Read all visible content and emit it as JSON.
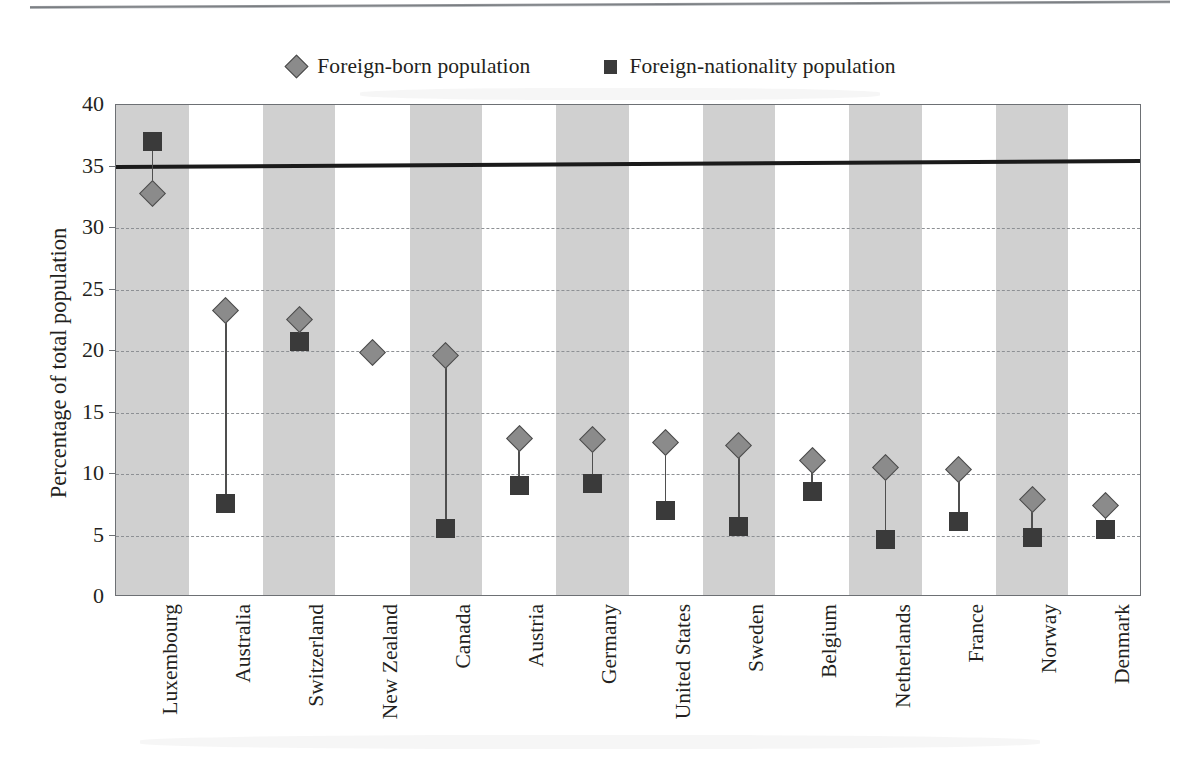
{
  "chart_data": {
    "type": "scatter",
    "title": "",
    "subtitle": "",
    "xlabel": "",
    "ylabel": "Percentage of total population",
    "ylim": [
      0,
      40
    ],
    "ytick_step": 5,
    "yticks": [
      "0",
      "5",
      "10",
      "15",
      "20",
      "25",
      "30",
      "35",
      "40"
    ],
    "grid": "horizontal-dashed",
    "legend_position": "top-center",
    "reference_line": {
      "value": 35,
      "style": "thick-solid",
      "color": "#1b1b1b"
    },
    "categories": [
      "Luxembourg",
      "Australia",
      "Switzerland",
      "New Zealand",
      "Canada",
      "Austria",
      "Germany",
      "United States",
      "Sweden",
      "Belgium",
      "Netherlands",
      "France",
      "Norway",
      "Denmark"
    ],
    "series": [
      {
        "name": "Foreign-born population",
        "marker": "diamond",
        "color": "#8b8b8b",
        "values": [
          32.8,
          23.3,
          22.6,
          19.9,
          19.6,
          12.9,
          12.8,
          12.6,
          12.3,
          11.1,
          10.5,
          10.4,
          7.9,
          7.4
        ]
      },
      {
        "name": "Foreign-nationality population",
        "marker": "square",
        "color": "#3a3a3a",
        "values": [
          37.0,
          7.6,
          20.8,
          null,
          5.6,
          9.1,
          9.2,
          7.0,
          5.7,
          8.6,
          4.7,
          6.1,
          4.8,
          5.5
        ]
      }
    ]
  },
  "legend": {
    "items": [
      {
        "label": "Foreign-born population",
        "marker": "diamond-icon"
      },
      {
        "label": "Foreign-nationality population",
        "marker": "square-icon"
      }
    ]
  },
  "colors": {
    "band": "#c9c9c9",
    "grid": "#8d9094",
    "frame": "#6d7074",
    "diamond": "#8b8b8b",
    "square": "#3a3a3a",
    "reference_line": "#1b1b1b",
    "text": "#231f20"
  }
}
